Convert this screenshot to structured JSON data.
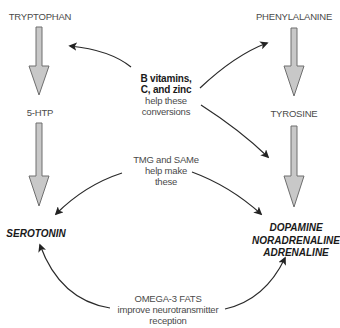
{
  "pathways": {
    "left": {
      "start": "TRYPTOPHAN",
      "intermediate": "5-HTP",
      "end": "SEROTONIN"
    },
    "right": {
      "start": "PHENYLALANINE",
      "intermediate": "TYROSINE",
      "end_lines": [
        "DOPAMINE",
        "NORADRENALINE",
        "ADRENALINE"
      ]
    }
  },
  "cofactors": {
    "b_vitamins": {
      "bold_lines": [
        "B vitamins,",
        "C, and zinc"
      ],
      "lines": [
        "help these",
        "conversions"
      ]
    },
    "tmg_same": {
      "lines": [
        "TMG and SAMe",
        "help make",
        "these"
      ]
    },
    "omega3": {
      "lines": [
        "OMEGA-3 FATS",
        "improve neurotransmitter",
        "reception"
      ]
    }
  },
  "colors": {
    "block_arrow_fill": "#c8c8c8",
    "block_arrow_stroke": "#6e6e6e",
    "curve_arrow": "#2a2a2a",
    "text": "#4a4a4a",
    "bold_text": "#1a1a1a"
  }
}
